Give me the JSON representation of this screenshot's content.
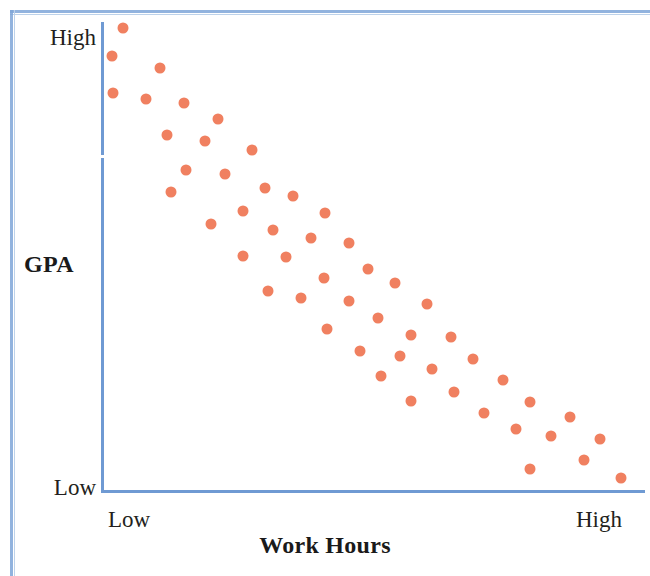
{
  "figure": {
    "kind": "scatter-plot",
    "accent_color": "#f08060",
    "axis_color": "#6f9ad3",
    "frame_color": "#7fa6d8",
    "text_color": "#231f20"
  },
  "axes": {
    "y_title": "GPA",
    "x_title": "Work Hours",
    "y_tick_high": "High",
    "y_tick_low": "Low",
    "x_tick_low": "Low",
    "x_tick_high": "High"
  },
  "chart_data": {
    "type": "scatter",
    "title": "",
    "subtitle": "",
    "xlabel": "Work Hours",
    "ylabel": "GPA",
    "xlim": [
      0,
      100
    ],
    "ylim": [
      0,
      100
    ],
    "x_tick_labels": [
      "Low",
      "High"
    ],
    "y_tick_labels": [
      "Low",
      "High"
    ],
    "grid": false,
    "legend": null,
    "annotations": [],
    "relationship": "negative correlation between work hours and GPA",
    "marker": {
      "shape": "circle",
      "color": "#f08060",
      "size_px": 11
    },
    "series": [
      {
        "name": "students",
        "points": [
          [
            3.7,
            99.2
          ],
          [
            1.6,
            93.2
          ],
          [
            10.6,
            90.6
          ],
          [
            1.8,
            85.1
          ],
          [
            8.0,
            83.8
          ],
          [
            15.0,
            83.0
          ],
          [
            21.3,
            79.6
          ],
          [
            11.8,
            76.2
          ],
          [
            18.8,
            74.9
          ],
          [
            27.6,
            73.0
          ],
          [
            15.4,
            68.7
          ],
          [
            22.5,
            67.9
          ],
          [
            30.0,
            64.9
          ],
          [
            12.5,
            64.0
          ],
          [
            35.2,
            63.1
          ],
          [
            26.0,
            59.8
          ],
          [
            41.2,
            59.4
          ],
          [
            20.0,
            57.0
          ],
          [
            31.5,
            55.9
          ],
          [
            38.5,
            54.0
          ],
          [
            45.6,
            53.0
          ],
          [
            26.0,
            50.2
          ],
          [
            33.8,
            50.0
          ],
          [
            49.0,
            47.4
          ],
          [
            41.0,
            45.5
          ],
          [
            54.0,
            44.4
          ],
          [
            30.5,
            42.6
          ],
          [
            36.6,
            41.3
          ],
          [
            45.5,
            40.6
          ],
          [
            60.0,
            40.0
          ],
          [
            51.0,
            37.0
          ],
          [
            41.5,
            34.5
          ],
          [
            57.0,
            33.2
          ],
          [
            64.5,
            32.9
          ],
          [
            47.5,
            29.9
          ],
          [
            55.0,
            28.8
          ],
          [
            68.6,
            28.2
          ],
          [
            61.0,
            26.0
          ],
          [
            51.4,
            24.4
          ],
          [
            74.0,
            23.5
          ],
          [
            65.0,
            21.0
          ],
          [
            57.0,
            19.0
          ],
          [
            79.0,
            18.9
          ],
          [
            70.5,
            16.5
          ],
          [
            86.4,
            15.6
          ],
          [
            76.5,
            13.1
          ],
          [
            83.0,
            11.6
          ],
          [
            92.0,
            11.0
          ],
          [
            89.0,
            6.5
          ],
          [
            79.0,
            4.4
          ],
          [
            96.0,
            2.6
          ]
        ]
      }
    ]
  },
  "plot_geometry": {
    "left_px": 103,
    "right_px": 643,
    "top_px": 24,
    "bottom_px": 490
  }
}
